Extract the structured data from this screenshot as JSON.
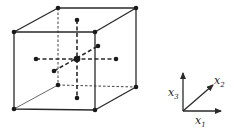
{
  "figure": {
    "colors": {
      "stroke": "#2a2a2a",
      "background": "#ffffff"
    },
    "cube": {
      "vertices": {
        "front_top_left": [
          14,
          32
        ],
        "front_top_right": [
          95,
          32
        ],
        "front_bottom_left": [
          14,
          109
        ],
        "front_bottom_right": [
          95,
          110
        ],
        "back_top_left": [
          58,
          8
        ],
        "back_top_right": [
          136,
          8
        ],
        "back_bottom_left": [
          58,
          85
        ],
        "back_bottom_right": [
          136,
          87
        ]
      },
      "center": [
        77,
        59
      ],
      "interior_points": {
        "top": [
          77,
          20
        ],
        "bottom": [
          77,
          98
        ],
        "left": [
          36,
          59
        ],
        "right": [
          116,
          59
        ],
        "front": [
          54,
          71
        ],
        "back": [
          98,
          46
        ]
      }
    },
    "axes": {
      "origin": [
        183,
        111
      ],
      "x1": {
        "label": "x",
        "subscript": "1",
        "tip": [
          222,
          111
        ]
      },
      "x2": {
        "label": "x",
        "subscript": "2",
        "tip": [
          214,
          84
        ]
      },
      "x3": {
        "label": "x",
        "subscript": "3",
        "tip": [
          183,
          72
        ]
      }
    }
  }
}
